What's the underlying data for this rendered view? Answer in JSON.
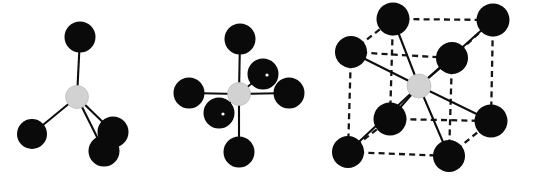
{
  "figure": {
    "name": "coordination-geometry-figure",
    "width": 533,
    "height": 182,
    "background_color": "#ffffff"
  },
  "palette": {
    "ligand_atom_color": "#0a0a0a",
    "center_atom_color": "#d2d2d2",
    "center_atom_outline": "#b9b9b9",
    "solid_bond_color": "#0d0d0d",
    "dashed_bond_color": "#151515"
  },
  "structures": [
    {
      "id": "tetrahedral",
      "label": "tetrahedral-coordination",
      "coordination_number": 4,
      "center": {
        "name": "center-atom",
        "cx": 77,
        "cy": 97,
        "r": 11.5
      },
      "ligands": [
        {
          "name": "ligand-top",
          "cx": 80,
          "cy": 37,
          "r": 15.5
        },
        {
          "name": "ligand-left",
          "cx": 32,
          "cy": 134,
          "r": 15.0
        },
        {
          "name": "ligand-lower-right",
          "cx": 113,
          "cy": 132,
          "r": 15.5
        },
        {
          "name": "ligand-bottom-right",
          "cx": 104,
          "cy": 151,
          "r": 15.5
        }
      ],
      "bonds": [
        {
          "name": "bond-center-top",
          "from": [
            77,
            97
          ],
          "to": [
            80,
            37
          ],
          "style": "solid"
        },
        {
          "name": "bond-center-left",
          "from": [
            77,
            97
          ],
          "to": [
            32,
            134
          ],
          "style": "solid"
        },
        {
          "name": "bond-center-lower-right",
          "from": [
            77,
            97
          ],
          "to": [
            113,
            132
          ],
          "style": "solid"
        },
        {
          "name": "bond-center-bottom-right",
          "from": [
            77,
            97
          ],
          "to": [
            104,
            151
          ],
          "style": "solid"
        }
      ]
    },
    {
      "id": "octahedral",
      "label": "octahedral-coordination",
      "coordination_number": 6,
      "center": {
        "name": "center-atom",
        "cx": 239,
        "cy": 94,
        "r": 11.5
      },
      "ligands": [
        {
          "name": "ligand-up",
          "cx": 240,
          "cy": 39,
          "r": 15.5,
          "pinhole": false
        },
        {
          "name": "ligand-down",
          "cx": 239,
          "cy": 152,
          "r": 15.5,
          "pinhole": false
        },
        {
          "name": "ligand-left",
          "cx": 189,
          "cy": 93,
          "r": 15.5,
          "pinhole": false
        },
        {
          "name": "ligand-right",
          "cx": 289,
          "cy": 93,
          "r": 15.5,
          "pinhole": false
        },
        {
          "name": "ligand-back-right",
          "cx": 263,
          "cy": 74,
          "r": 15.5,
          "pinhole": true
        },
        {
          "name": "ligand-front-left",
          "cx": 219,
          "cy": 113,
          "r": 15.5,
          "pinhole": true
        }
      ],
      "bonds": [
        {
          "name": "bond-center-up",
          "from": [
            239,
            94
          ],
          "to": [
            240,
            39
          ],
          "style": "solid"
        },
        {
          "name": "bond-center-down",
          "from": [
            239,
            94
          ],
          "to": [
            239,
            152
          ],
          "style": "solid"
        },
        {
          "name": "bond-center-left",
          "from": [
            239,
            94
          ],
          "to": [
            189,
            93
          ],
          "style": "solid"
        },
        {
          "name": "bond-center-right",
          "from": [
            239,
            94
          ],
          "to": [
            289,
            93
          ],
          "style": "solid"
        },
        {
          "name": "bond-center-back-right",
          "from": [
            239,
            94
          ],
          "to": [
            263,
            74
          ],
          "style": "solid-thin"
        },
        {
          "name": "bond-center-front-left",
          "from": [
            239,
            94
          ],
          "to": [
            219,
            113
          ],
          "style": "solid-thin"
        }
      ]
    },
    {
      "id": "cubic",
      "label": "body-centred-cubic-coordination",
      "coordination_number": 8,
      "center": {
        "name": "center-atom",
        "cx": 419,
        "cy": 86,
        "r": 12.0
      },
      "ligands": [
        {
          "name": "vertex-back-top-left",
          "cx": 393,
          "cy": 19,
          "r": 16.5
        },
        {
          "name": "vertex-back-top-right",
          "cx": 493,
          "cy": 20,
          "r": 16.5
        },
        {
          "name": "vertex-front-top-left",
          "cx": 351,
          "cy": 52,
          "r": 16.0
        },
        {
          "name": "vertex-front-top-right",
          "cx": 452,
          "cy": 58,
          "r": 16.0
        },
        {
          "name": "vertex-back-bottom-left",
          "cx": 390,
          "cy": 119,
          "r": 16.5
        },
        {
          "name": "vertex-back-bottom-right",
          "cx": 491,
          "cy": 121,
          "r": 16.5
        },
        {
          "name": "vertex-front-bottom-left",
          "cx": 348,
          "cy": 152,
          "r": 16.0
        },
        {
          "name": "vertex-front-bottom-right",
          "cx": 449,
          "cy": 156,
          "r": 16.0
        }
      ],
      "cube_edges": [
        {
          "name": "edge-back-top",
          "from": [
            393,
            19
          ],
          "to": [
            493,
            20
          ],
          "style": "dashed"
        },
        {
          "name": "edge-back-left-vertical",
          "from": [
            393,
            19
          ],
          "to": [
            390,
            119
          ],
          "style": "dashed"
        },
        {
          "name": "edge-back-right-vertical",
          "from": [
            493,
            20
          ],
          "to": [
            491,
            121
          ],
          "style": "dashed"
        },
        {
          "name": "edge-back-bottom",
          "from": [
            390,
            119
          ],
          "to": [
            491,
            121
          ],
          "style": "dashed"
        },
        {
          "name": "edge-front-top",
          "from": [
            351,
            52
          ],
          "to": [
            452,
            58
          ],
          "style": "dashed"
        },
        {
          "name": "edge-front-left-vertical",
          "from": [
            351,
            52
          ],
          "to": [
            348,
            152
          ],
          "style": "dashed"
        },
        {
          "name": "edge-front-right-vertical",
          "from": [
            452,
            58
          ],
          "to": [
            449,
            156
          ],
          "style": "dashed"
        },
        {
          "name": "edge-front-bottom",
          "from": [
            348,
            152
          ],
          "to": [
            449,
            156
          ],
          "style": "dashed"
        },
        {
          "name": "edge-depth-top-left",
          "from": [
            351,
            52
          ],
          "to": [
            393,
            19
          ],
          "style": "dashed"
        },
        {
          "name": "edge-depth-top-right",
          "from": [
            452,
            58
          ],
          "to": [
            493,
            20
          ],
          "style": "dashed"
        },
        {
          "name": "edge-depth-bottom-left",
          "from": [
            348,
            152
          ],
          "to": [
            390,
            119
          ],
          "style": "dashed"
        },
        {
          "name": "edge-depth-bottom-right",
          "from": [
            449,
            156
          ],
          "to": [
            491,
            121
          ],
          "style": "dashed"
        }
      ],
      "bonds": [
        {
          "name": "bond-center-back-top-left",
          "from": [
            419,
            86
          ],
          "to": [
            393,
            19
          ],
          "style": "solid"
        },
        {
          "name": "bond-center-back-top-right",
          "from": [
            419,
            86
          ],
          "to": [
            493,
            20
          ],
          "style": "solid"
        },
        {
          "name": "bond-center-front-top-left",
          "from": [
            419,
            86
          ],
          "to": [
            351,
            52
          ],
          "style": "solid"
        },
        {
          "name": "bond-center-front-top-right",
          "from": [
            419,
            86
          ],
          "to": [
            452,
            58
          ],
          "style": "solid"
        },
        {
          "name": "bond-center-back-bottom-left",
          "from": [
            419,
            86
          ],
          "to": [
            390,
            119
          ],
          "style": "solid"
        },
        {
          "name": "bond-center-back-bottom-right",
          "from": [
            419,
            86
          ],
          "to": [
            491,
            121
          ],
          "style": "solid"
        },
        {
          "name": "bond-center-front-bottom-left",
          "from": [
            419,
            86
          ],
          "to": [
            348,
            152
          ],
          "style": "solid"
        },
        {
          "name": "bond-center-front-bottom-right",
          "from": [
            419,
            86
          ],
          "to": [
            449,
            156
          ],
          "style": "solid"
        }
      ]
    }
  ]
}
